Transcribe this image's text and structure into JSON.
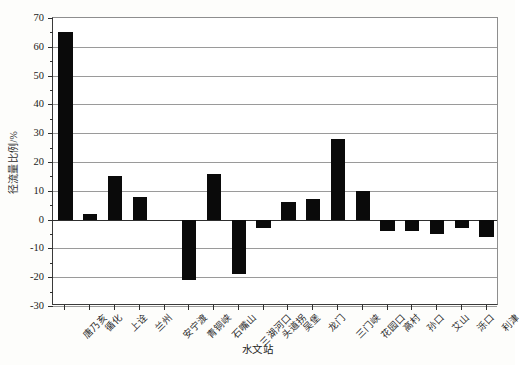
{
  "chart_data": {
    "type": "bar",
    "title": "",
    "xlabel": "水文站",
    "ylabel": "径流量比例/%",
    "ylim": [
      -30,
      70
    ],
    "ytick_step": 10,
    "grid": true,
    "legend": "none",
    "bar_color": "#0a0a0a",
    "categories": [
      "唐乃亥",
      "循化",
      "上诠",
      "兰州",
      "安宁渡",
      "青铜峡",
      "石嘴山",
      "三湖河口",
      "头道拐",
      "吴堡",
      "龙门",
      "三门峡",
      "花园口",
      "高村",
      "孙口",
      "艾山",
      "泺口",
      "利津"
    ],
    "values": [
      65,
      2,
      15,
      8,
      0,
      -21,
      16,
      -19,
      -3,
      6,
      7,
      28,
      10,
      -4,
      -4,
      -5,
      -3,
      -6
    ],
    "yticks": [
      70,
      60,
      50,
      40,
      30,
      20,
      10,
      0,
      -10,
      -20,
      -30
    ],
    "ytick_labels": [
      "70",
      "60",
      "50",
      "40",
      "30",
      "20",
      "10",
      "0",
      "-10",
      "-20",
      "-30"
    ]
  },
  "axes": {
    "y_title": "径流量比例/%",
    "x_title": "水文站"
  }
}
